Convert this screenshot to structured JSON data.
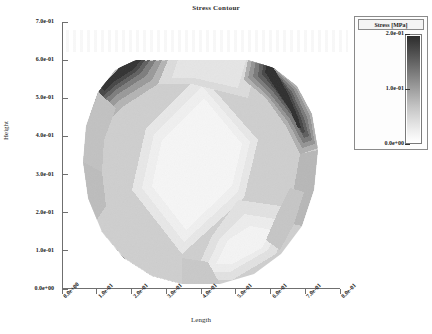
{
  "figure": {
    "title": "Stress Contour",
    "background": "#ffffff"
  },
  "axes": {
    "x": {
      "label": "Length",
      "ticks": [
        "0.0e+00",
        "1.0e-01",
        "2.0e-01",
        "3.0e-01",
        "4.0e-01",
        "5.0e-01",
        "6.0e-01",
        "7.0e-01",
        "8.0e-01"
      ],
      "values": [
        0.0,
        0.1,
        0.2,
        0.3,
        0.4,
        0.5,
        0.6,
        0.7,
        0.8
      ],
      "min": 0.0,
      "max": 0.8
    },
    "y": {
      "label": "Height",
      "ticks": [
        "0.0e+00",
        "1.0e-01",
        "2.0e-01",
        "3.0e-01",
        "4.0e-01",
        "5.0e-01",
        "6.0e-01",
        "7.0e-01"
      ],
      "values": [
        0.0,
        0.1,
        0.2,
        0.3,
        0.4,
        0.5,
        0.6,
        0.7
      ],
      "min": 0.0,
      "max": 0.7
    }
  },
  "legend": {
    "title": "Stress [MPa]",
    "ticks": [
      "2.0e-01",
      "1.0e-01",
      "0.0e+00"
    ],
    "values": [
      0.2,
      0.1,
      0.0
    ],
    "min": 0.0,
    "max": 0.2,
    "colormap": "grayscale-reversed",
    "colors": [
      "#ffffff",
      "#ededed",
      "#d9d9d9",
      "#c4c4c4",
      "#ababab",
      "#929292",
      "#787878",
      "#5e5e5e",
      "#454545",
      "#2d2d2d"
    ]
  },
  "chart_data": {
    "type": "heatmap",
    "title": "Stress Contour",
    "xlabel": "Length",
    "ylabel": "Height",
    "xlim": [
      0.0,
      0.8
    ],
    "ylim": [
      0.0,
      0.7
    ],
    "zlabel": "Stress [MPa]",
    "zlim": [
      0.0,
      0.2
    ],
    "grid": false,
    "legend_position": "upper-right-outside",
    "colorbar_ticks": [
      0.0,
      0.1,
      0.2
    ],
    "domain_description": "rounded octagonal cross-section with flat top edge at y=0.60, spanning x=0.02 to x=0.75",
    "regions": [
      {
        "name": "upper-left-corner",
        "stress": 0.19,
        "x": 0.1,
        "y": 0.55
      },
      {
        "name": "upper-right-corner",
        "stress": 0.2,
        "x": 0.62,
        "y": 0.56
      },
      {
        "name": "lower-left-corner",
        "stress": 0.18,
        "x": 0.2,
        "y": 0.04
      },
      {
        "name": "central-diamond",
        "stress": 0.03,
        "x": 0.38,
        "y": 0.35
      },
      {
        "name": "upper-middle-band",
        "stress": 0.05,
        "x": 0.35,
        "y": 0.52
      },
      {
        "name": "left-mid-band",
        "stress": 0.09,
        "x": 0.1,
        "y": 0.35
      },
      {
        "name": "right-mid-band",
        "stress": 0.11,
        "x": 0.66,
        "y": 0.3
      },
      {
        "name": "lower-right-region",
        "stress": 0.04,
        "x": 0.58,
        "y": 0.12
      },
      {
        "name": "bottom-center",
        "stress": 0.07,
        "x": 0.4,
        "y": 0.03
      }
    ],
    "contour_levels": [
      0.0,
      0.02,
      0.04,
      0.06,
      0.08,
      0.1,
      0.12,
      0.14,
      0.16,
      0.18,
      0.2
    ]
  }
}
